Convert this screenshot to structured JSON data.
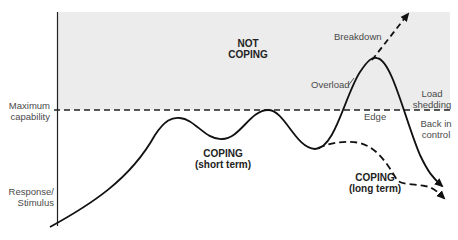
{
  "diagram": {
    "type": "stress-response curve",
    "colors": {
      "shaded_region": "#ececec",
      "line": "#111111",
      "text": "#4a4a4a"
    },
    "axis": {
      "y_label_line1": "Response/",
      "y_label_line2": "Stimulus"
    },
    "threshold": {
      "label_line1": "Maximum",
      "label_line2": "capability"
    },
    "regions": {
      "not_coping_line1": "NOT",
      "not_coping_line2": "COPING",
      "coping_short_line1": "COPING",
      "coping_short_line2": "(short term)",
      "coping_long_line1": "COPING",
      "coping_long_line2": "(long term)"
    },
    "annotations": {
      "breakdown": "Breakdown",
      "overload": "Overload",
      "edge": "Edge",
      "load_shedding_line1": "Load",
      "load_shedding_line2": "shedding",
      "back_in_control_line1": "Back in",
      "back_in_control_line2": "control"
    }
  }
}
